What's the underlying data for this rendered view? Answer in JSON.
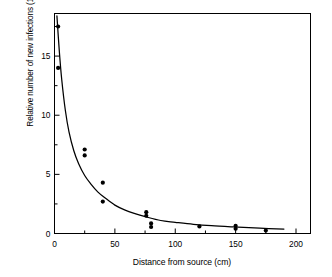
{
  "chart_data": {
    "type": "scatter",
    "title": "",
    "subtitle": "",
    "xlabel": "Distance from source (cm)",
    "ylabel": "Relative number of new infections (10",
    "ylabel_exponent": "−3",
    "ylabel_close": ")",
    "ylabel_full": "Relative number of new infections (10⁻³)",
    "xlim": [
      0,
      212
    ],
    "ylim": [
      0,
      18.6
    ],
    "xticks": [
      0,
      50,
      100,
      150,
      200
    ],
    "xticklabels": [
      "0",
      "50",
      "100",
      "150",
      "200"
    ],
    "xticks_minor": [
      25,
      75,
      125,
      175
    ],
    "yticks": [
      0,
      5,
      10,
      15
    ],
    "yticklabels": [
      "0",
      "5",
      "10",
      "15"
    ],
    "yticks_minor": [
      2.5,
      7.5,
      12.5,
      17.5
    ],
    "grid": false,
    "legend": null,
    "frame": "box",
    "tick_direction": "in",
    "marker": "filled-circle",
    "marker_color": "#000000",
    "line_color": "#000000",
    "background": "#ffffff",
    "points": [
      {
        "x": 3,
        "y": 17.5
      },
      {
        "x": 3,
        "y": 14.0
      },
      {
        "x": 25,
        "y": 7.1
      },
      {
        "x": 25,
        "y": 6.6
      },
      {
        "x": 40,
        "y": 4.3
      },
      {
        "x": 40,
        "y": 2.7
      },
      {
        "x": 76,
        "y": 1.8
      },
      {
        "x": 76,
        "y": 1.5
      },
      {
        "x": 80,
        "y": 0.85
      },
      {
        "x": 80,
        "y": 0.55
      },
      {
        "x": 120,
        "y": 0.6
      },
      {
        "x": 150,
        "y": 0.65
      },
      {
        "x": 150,
        "y": 0.4
      },
      {
        "x": 175,
        "y": 0.25
      }
    ],
    "fit_curve": {
      "description": "fitted exponential-decay curve through the scatter",
      "x": [
        2,
        4,
        6,
        9,
        12,
        16,
        20,
        25,
        30,
        36,
        42,
        50,
        58,
        66,
        76,
        88,
        100,
        115,
        130,
        150,
        170,
        190
      ],
      "y": [
        18.4,
        15.4,
        13.0,
        10.4,
        8.6,
        7.0,
        5.9,
        4.9,
        4.2,
        3.5,
        3.0,
        2.4,
        2.0,
        1.7,
        1.4,
        1.1,
        0.95,
        0.78,
        0.66,
        0.55,
        0.45,
        0.38
      ]
    }
  }
}
